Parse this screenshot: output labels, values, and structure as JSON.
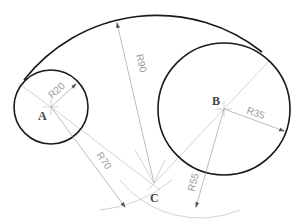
{
  "diagram": {
    "type": "tangent-arc-construction",
    "points": [
      {
        "label": "A",
        "x": 51,
        "y": 107
      },
      {
        "label": "B",
        "x": 224,
        "y": 109
      },
      {
        "label": "C",
        "x": 154,
        "y": 183
      }
    ],
    "circles": [
      {
        "name": "circle-A",
        "center": "A",
        "radius_label": "R20"
      },
      {
        "name": "circle-B",
        "center": "B",
        "radius_label": "R35"
      }
    ],
    "arcs": [
      {
        "name": "tangent-arc",
        "center": "C",
        "radius_label": "R90"
      },
      {
        "name": "construction-arc-A",
        "center": "A",
        "radius_label": "R70"
      },
      {
        "name": "construction-arc-B",
        "center": "B",
        "radius_label": "R55"
      }
    ],
    "labels": {
      "point_a": "A",
      "point_b": "B",
      "point_c": "C",
      "r20": "R20",
      "r35": "R35",
      "r90": "R90",
      "r70": "R70",
      "r55": "R55"
    }
  }
}
